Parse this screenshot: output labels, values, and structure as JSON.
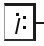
{
  "diagram": {
    "node": {
      "label": "i:",
      "letter": "i",
      "punctuation": ":",
      "border_color": "#1b1b1b",
      "fill_color": "#ffffff"
    },
    "connector": {
      "label": "",
      "color": "#1b1b1b",
      "direction": "right"
    },
    "background_color": "#fdfdfd",
    "ink_color": "#141414"
  }
}
